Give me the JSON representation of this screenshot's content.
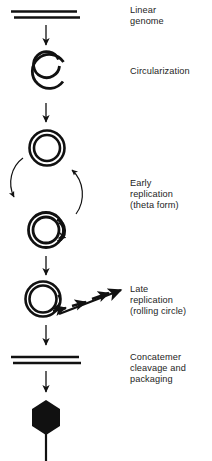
{
  "figure": {
    "ink_color": "#111111",
    "text_color": "#242424",
    "background": "#ffffff",
    "width": 212,
    "height": 461
  },
  "labels": {
    "linear_genome": "Linear\ngenome",
    "circularization": "Circularization",
    "early_replication": "Early\nreplication\n(theta form)",
    "late_replication": "Late\nreplication\n(rolling circle)",
    "concatemer": "Concatemer\ncleavage and\npackaging"
  },
  "stages": [
    {
      "id": "linear-genome",
      "label": "Linear\ngenome",
      "shape": "two-parallel-horizontal-lines",
      "description": "Linear double-stranded genome drawn as two parallel horizontal bars"
    },
    {
      "id": "circularization",
      "label": "Circularization",
      "shape": "open-circle-with-gap",
      "description": "Double-line circle with a gap at the upper right, ends overlapping"
    },
    {
      "id": "closed-circle",
      "label": "",
      "shape": "double-concentric-circle",
      "description": "Closed circular genome drawn as two concentric rings"
    },
    {
      "id": "theta-form",
      "label": "Early\nreplication\n(theta form)",
      "shape": "circle-with-replication-bubble",
      "description": "Circle with a replication bubble (theta structure) on its right side, with a small arrow at the replication fork"
    },
    {
      "id": "rolling-circle",
      "label": "Late\nreplication\n(rolling circle)",
      "shape": "circle-with-dashed-arrow-tail",
      "description": "Circle with a rotation arrow and a dashed arrow tail extending to the upper right"
    },
    {
      "id": "concatemer",
      "label": "Concatemer\ncleavage and\npackaging",
      "shape": "two-parallel-horizontal-lines",
      "description": "Long concatemeric DNA drawn as two parallel horizontal bars"
    },
    {
      "id": "phage-particle",
      "label": "",
      "shape": "filled-hexagon-with-tail",
      "description": "Assembled bacteriophage virion: filled black hexagonal capsid with a vertical tail"
    }
  ],
  "arrows": {
    "flow_arrows": 5,
    "cycle_arrows": 2,
    "cycle_note": "Two curved arrows form a loop between the closed circle and the theta form"
  }
}
